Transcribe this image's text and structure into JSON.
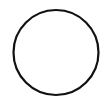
{
  "shape": {
    "type": "circle",
    "fill": "none",
    "stroke_color": "#111111",
    "background_color": "#ffffff"
  }
}
